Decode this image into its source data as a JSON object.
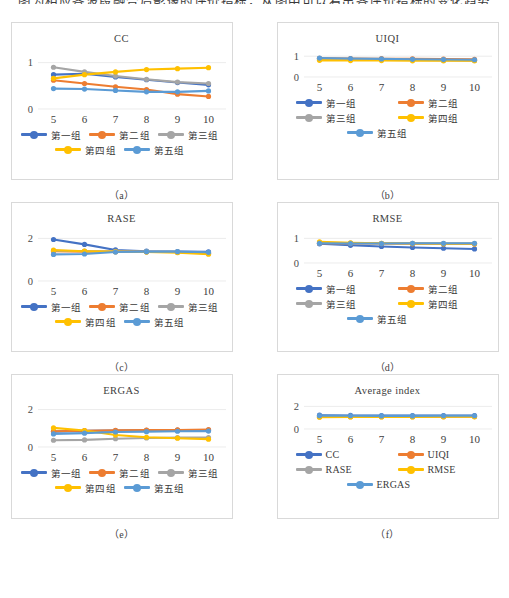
{
  "page": {
    "top_text_clipped": "图为相应各波段融合后影像的评价指标，从图中可以看出各评价指标的变化趋势",
    "series_colors": {
      "group1": "#4472C4",
      "group2": "#ED7D31",
      "group3": "#A5A5A5",
      "group4": "#FFC000",
      "group5": "#5B9BD5"
    },
    "axis_color": "#8c8c8c",
    "grid_color": "#e4e4e4",
    "frame_color": "#d9d9d9"
  },
  "legend_labels": {
    "g1": "第一组",
    "g2": "第二组",
    "g3": "第三组",
    "g4": "第四组",
    "g5": "第五组",
    "cc": "CC",
    "uiqi": "UIQI",
    "rase": "RASE",
    "rmse": "RMSE",
    "ergas": "ERGAS"
  },
  "captions": {
    "a": "（a）",
    "b": "（b）",
    "c": "（c）",
    "d": "（d）",
    "e": "（e）",
    "f": "（f）"
  },
  "chart_data": [
    {
      "id": "a",
      "type": "line",
      "title": "CC",
      "xlabel": "",
      "ylabel": "",
      "x": [
        5,
        6,
        7,
        8,
        9,
        10
      ],
      "xticks": [
        "5",
        "6",
        "7",
        "8",
        "9",
        "10"
      ],
      "yticks": [
        "1",
        "0"
      ],
      "ylim": [
        0,
        1.25
      ],
      "ytickvals": [
        1,
        0
      ],
      "grid": true,
      "legend_position": "bottom",
      "legend_columns": 3,
      "series": [
        {
          "name": "第一组",
          "color": "#4472C4",
          "values": [
            0.74,
            0.76,
            0.69,
            0.63,
            0.57,
            0.52
          ]
        },
        {
          "name": "第二组",
          "color": "#ED7D31",
          "values": [
            0.62,
            0.55,
            0.48,
            0.42,
            0.32,
            0.27
          ]
        },
        {
          "name": "第三组",
          "color": "#A5A5A5",
          "values": [
            0.9,
            0.8,
            0.71,
            0.64,
            0.58,
            0.55
          ]
        },
        {
          "name": "第四组",
          "color": "#FFC000",
          "values": [
            0.66,
            0.74,
            0.8,
            0.85,
            0.87,
            0.89
          ]
        },
        {
          "name": "第五组",
          "color": "#5B9BD5",
          "values": [
            0.44,
            0.43,
            0.4,
            0.37,
            0.37,
            0.39
          ]
        }
      ]
    },
    {
      "id": "b",
      "type": "line",
      "title": "UIQI",
      "xlabel": "",
      "ylabel": "",
      "x": [
        5,
        6,
        7,
        8,
        9,
        10
      ],
      "xticks": [
        "5",
        "6",
        "7",
        "8",
        "9",
        "10"
      ],
      "yticks": [
        "1",
        "0"
      ],
      "ylim": [
        0,
        1.25
      ],
      "ytickvals": [
        1,
        0
      ],
      "grid": true,
      "legend_position": "bottom",
      "legend_columns": 2,
      "series": [
        {
          "name": "第一组",
          "color": "#4472C4",
          "values": [
            0.88,
            0.86,
            0.84,
            0.82,
            0.81,
            0.8
          ]
        },
        {
          "name": "第二组",
          "color": "#ED7D31",
          "values": [
            0.9,
            0.89,
            0.88,
            0.87,
            0.86,
            0.85
          ]
        },
        {
          "name": "第三组",
          "color": "#A5A5A5",
          "values": [
            0.86,
            0.85,
            0.84,
            0.83,
            0.82,
            0.81
          ]
        },
        {
          "name": "第四组",
          "color": "#FFC000",
          "values": [
            0.8,
            0.79,
            0.79,
            0.78,
            0.78,
            0.78
          ]
        },
        {
          "name": "第五组",
          "color": "#5B9BD5",
          "values": [
            0.91,
            0.89,
            0.87,
            0.85,
            0.84,
            0.83
          ]
        }
      ]
    },
    {
      "id": "c",
      "type": "line",
      "title": "RASE",
      "xlabel": "",
      "ylabel": "",
      "x": [
        5,
        6,
        7,
        8,
        9,
        10
      ],
      "xticks": [
        "5",
        "6",
        "7",
        "8",
        "9",
        "10"
      ],
      "yticks": [
        "2",
        "0"
      ],
      "ylim": [
        0,
        2.35
      ],
      "ytickvals": [
        2,
        0
      ],
      "grid": true,
      "legend_position": "bottom",
      "legend_columns": 3,
      "series": [
        {
          "name": "第一组",
          "color": "#4472C4",
          "values": [
            1.95,
            1.72,
            1.46,
            1.4,
            1.38,
            1.37
          ]
        },
        {
          "name": "第二组",
          "color": "#ED7D31",
          "values": [
            1.4,
            1.38,
            1.38,
            1.37,
            1.36,
            1.3
          ]
        },
        {
          "name": "第三组",
          "color": "#A5A5A5",
          "values": [
            1.42,
            1.4,
            1.39,
            1.38,
            1.37,
            1.31
          ]
        },
        {
          "name": "第四组",
          "color": "#FFC000",
          "values": [
            1.45,
            1.4,
            1.38,
            1.36,
            1.33,
            1.26
          ]
        },
        {
          "name": "第五组",
          "color": "#5B9BD5",
          "values": [
            1.25,
            1.27,
            1.36,
            1.38,
            1.38,
            1.35
          ]
        }
      ]
    },
    {
      "id": "d",
      "type": "line",
      "title": "RMSE",
      "xlabel": "",
      "ylabel": "",
      "x": [
        5,
        6,
        7,
        8,
        9,
        10
      ],
      "xticks": [
        "5",
        "6",
        "7",
        "8",
        "9",
        "10"
      ],
      "yticks": [
        "1",
        "0"
      ],
      "ylim": [
        0,
        1.3
      ],
      "ytickvals": [
        1,
        0
      ],
      "grid": true,
      "legend_position": "bottom",
      "legend_columns": 2,
      "series": [
        {
          "name": "第一组",
          "color": "#4472C4",
          "values": [
            0.78,
            0.72,
            0.67,
            0.63,
            0.6,
            0.57
          ]
        },
        {
          "name": "第二组",
          "color": "#ED7D31",
          "values": [
            0.8,
            0.79,
            0.79,
            0.78,
            0.78,
            0.77
          ]
        },
        {
          "name": "第三组",
          "color": "#A5A5A5",
          "values": [
            0.82,
            0.81,
            0.8,
            0.8,
            0.79,
            0.79
          ]
        },
        {
          "name": "第四组",
          "color": "#FFC000",
          "values": [
            0.86,
            0.82,
            0.8,
            0.79,
            0.78,
            0.78
          ]
        },
        {
          "name": "第五组",
          "color": "#5B9BD5",
          "values": [
            0.8,
            0.79,
            0.79,
            0.8,
            0.8,
            0.8
          ]
        }
      ]
    },
    {
      "id": "e",
      "type": "line",
      "title": "ERGAS",
      "xlabel": "",
      "ylabel": "",
      "x": [
        5,
        6,
        7,
        8,
        9,
        10
      ],
      "xticks": [
        "5",
        "6",
        "7",
        "8",
        "9",
        "10"
      ],
      "yticks": [
        "2",
        "0"
      ],
      "ylim": [
        0,
        2.35
      ],
      "ytickvals": [
        2,
        0
      ],
      "grid": true,
      "legend_position": "bottom",
      "legend_columns": 3,
      "series": [
        {
          "name": "第一组",
          "color": "#4472C4",
          "values": [
            0.82,
            0.86,
            0.88,
            0.89,
            0.9,
            0.9
          ]
        },
        {
          "name": "第二组",
          "color": "#ED7D31",
          "values": [
            0.84,
            0.87,
            0.89,
            0.9,
            0.91,
            0.93
          ]
        },
        {
          "name": "第三组",
          "color": "#A5A5A5",
          "values": [
            0.36,
            0.38,
            0.44,
            0.48,
            0.5,
            0.5
          ]
        },
        {
          "name": "第四组",
          "color": "#FFC000",
          "values": [
            1.02,
            0.88,
            0.64,
            0.52,
            0.47,
            0.42
          ]
        },
        {
          "name": "第五组",
          "color": "#5B9BD5",
          "values": [
            0.7,
            0.74,
            0.8,
            0.82,
            0.84,
            0.85
          ]
        }
      ]
    },
    {
      "id": "f",
      "type": "line",
      "title": "Average index",
      "xlabel": "",
      "ylabel": "",
      "x": [
        5,
        6,
        7,
        8,
        9,
        10
      ],
      "xticks": [
        "5",
        "6",
        "7",
        "8",
        "9",
        "10"
      ],
      "yticks": [
        "2",
        "0"
      ],
      "ylim": [
        0,
        2.3
      ],
      "ytickvals": [
        2,
        0
      ],
      "grid": true,
      "legend_position": "bottom",
      "legend_columns": 2,
      "series": [
        {
          "name": "CC",
          "color": "#4472C4",
          "values": [
            1.22,
            1.2,
            1.19,
            1.18,
            1.19,
            1.19
          ]
        },
        {
          "name": "UIQI",
          "color": "#ED7D31",
          "values": [
            1.08,
            1.09,
            1.09,
            1.09,
            1.09,
            1.1
          ]
        },
        {
          "name": "RASE",
          "color": "#A5A5A5",
          "values": [
            1.1,
            1.11,
            1.11,
            1.11,
            1.11,
            1.12
          ]
        },
        {
          "name": "RMSE",
          "color": "#FFC000",
          "values": [
            1.04,
            1.06,
            1.07,
            1.07,
            1.08,
            1.08
          ]
        },
        {
          "name": "ERGAS",
          "color": "#5B9BD5",
          "values": [
            1.18,
            1.17,
            1.16,
            1.16,
            1.17,
            1.17
          ]
        }
      ]
    }
  ]
}
